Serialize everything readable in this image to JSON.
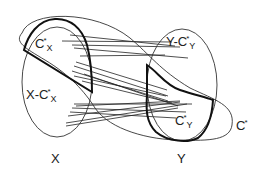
{
  "diagram": {
    "sets": {
      "X": {
        "label": "X"
      },
      "Y": {
        "label": "Y"
      }
    },
    "regions": {
      "cx": {
        "base": "C",
        "sup": "*",
        "sub": "X"
      },
      "x_minus_cx": {
        "prefix": "X-",
        "base": "C",
        "sup": "*",
        "sub": "X"
      },
      "cy": {
        "base": "C",
        "sup": "*",
        "sub": "Y"
      },
      "y_minus_cy": {
        "prefix": "Y-",
        "base": "C",
        "sup": "*",
        "sub": "Y"
      },
      "cstar": {
        "base": "C",
        "sup": "*"
      }
    },
    "colors": {
      "stroke": "#222222",
      "background": "#ffffff"
    },
    "edges": [
      [
        70,
        35,
        175,
        46
      ],
      [
        62,
        41,
        172,
        42
      ],
      [
        72,
        45,
        180,
        47
      ],
      [
        74,
        48,
        188,
        58
      ],
      [
        80,
        56,
        165,
        55
      ],
      [
        76,
        62,
        167,
        90
      ],
      [
        74,
        66,
        168,
        96
      ],
      [
        72,
        71,
        168,
        101
      ],
      [
        74,
        76,
        166,
        96
      ],
      [
        82,
        81,
        172,
        103
      ],
      [
        84,
        74,
        178,
        106
      ],
      [
        74,
        104,
        192,
        104
      ],
      [
        72,
        108,
        186,
        112
      ],
      [
        68,
        116,
        180,
        102
      ],
      [
        70,
        112,
        176,
        118
      ],
      [
        66,
        126,
        178,
        108
      ],
      [
        76,
        106,
        180,
        101
      ],
      [
        66,
        123,
        187,
        104
      ]
    ]
  }
}
